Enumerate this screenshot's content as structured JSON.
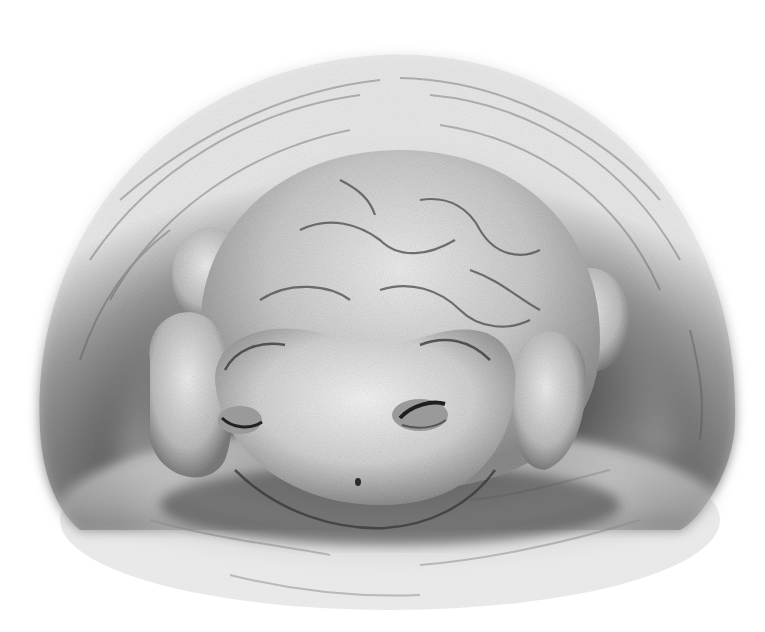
{
  "image": {
    "subject": "toad resting in a burrow",
    "style": "grayscale pencil illustration",
    "width": 765,
    "height": 632,
    "colors": {
      "background": "#ffffff",
      "burrow_dark": "#3a3a3a",
      "burrow_mid": "#7a7a7a",
      "toad_light": "#e4e4e4",
      "toad_mid": "#b8b8b8",
      "toad_shadow": "#6a6a6a",
      "ground": "#c8c8c8"
    }
  }
}
